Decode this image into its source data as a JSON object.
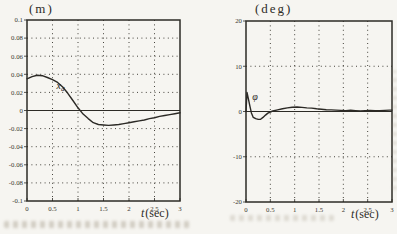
{
  "figure": {
    "paper_color": "#f6f5f1",
    "ink_color": "#2d2b26"
  },
  "chart_data": [
    {
      "type": "line",
      "title": "(m)",
      "xlabel": "t(sec)",
      "xlabel_parts": {
        "main": "t",
        "rest": "(sec)"
      },
      "xlim": [
        0,
        3
      ],
      "ylim": [
        -0.1,
        0.1
      ],
      "grid": "dotted",
      "legend": "none",
      "xticks": [
        {
          "v": 0,
          "label": "0"
        },
        {
          "v": 0.5,
          "label": "0.5"
        },
        {
          "v": 1,
          "label": "1"
        },
        {
          "v": 1.5,
          "label": "1.5"
        },
        {
          "v": 2,
          "label": "2"
        },
        {
          "v": 2.5,
          "label": "2.5"
        },
        {
          "v": 3,
          "label": "3"
        }
      ],
      "yticks": [
        {
          "v": 0.1,
          "label": "0.1"
        },
        {
          "v": 0.08,
          "label": "0.08"
        },
        {
          "v": 0.06,
          "label": "0.06"
        },
        {
          "v": 0.04,
          "label": "0.04"
        },
        {
          "v": 0.02,
          "label": "0.02"
        },
        {
          "v": 0,
          "label": "0"
        },
        {
          "v": -0.02,
          "label": "-0.02"
        },
        {
          "v": -0.04,
          "label": "-0.04"
        },
        {
          "v": -0.06,
          "label": "-0.06"
        },
        {
          "v": -0.08,
          "label": "-0.08"
        },
        {
          "v": -0.1,
          "label": "-0.1"
        }
      ],
      "series": [
        {
          "name": "x_d",
          "annotation": {
            "main": "x",
            "sub": "d",
            "at_t": 0.58,
            "at_y": 0.024
          },
          "points": [
            [
              0,
              0.035
            ],
            [
              0.1,
              0.0375
            ],
            [
              0.2,
              0.039
            ],
            [
              0.3,
              0.0385
            ],
            [
              0.4,
              0.0365
            ],
            [
              0.5,
              0.034
            ],
            [
              0.6,
              0.031
            ],
            [
              0.7,
              0.026
            ],
            [
              0.8,
              0.019
            ],
            [
              0.9,
              0.011
            ],
            [
              1.0,
              0.003
            ],
            [
              1.1,
              -0.004
            ],
            [
              1.2,
              -0.009
            ],
            [
              1.3,
              -0.0135
            ],
            [
              1.4,
              -0.0155
            ],
            [
              1.5,
              -0.016
            ],
            [
              1.6,
              -0.0165
            ],
            [
              1.7,
              -0.016
            ],
            [
              1.8,
              -0.0155
            ],
            [
              1.9,
              -0.0145
            ],
            [
              2.0,
              -0.0135
            ],
            [
              2.1,
              -0.0125
            ],
            [
              2.2,
              -0.0115
            ],
            [
              2.3,
              -0.0105
            ],
            [
              2.4,
              -0.009
            ],
            [
              2.5,
              -0.008
            ],
            [
              2.6,
              -0.0065
            ],
            [
              2.7,
              -0.0055
            ],
            [
              2.8,
              -0.0045
            ],
            [
              2.9,
              -0.0035
            ],
            [
              3.0,
              -0.0025
            ]
          ]
        }
      ]
    },
    {
      "type": "line",
      "title": "(deg)",
      "xlabel": "t(sec)",
      "xlabel_parts": {
        "main": "t",
        "rest": "(sec)"
      },
      "xlim": [
        0,
        3
      ],
      "ylim": [
        -20,
        20
      ],
      "grid": "dotted",
      "legend": "none",
      "xticks": [
        {
          "v": 0,
          "label": "0"
        },
        {
          "v": 0.5,
          "label": "0.5"
        },
        {
          "v": 1,
          "label": "1"
        },
        {
          "v": 1.5,
          "label": "1.5"
        },
        {
          "v": 2,
          "label": "2"
        },
        {
          "v": 2.5,
          "label": "2.5"
        },
        {
          "v": 3,
          "label": "3"
        }
      ],
      "yticks": [
        {
          "v": 20,
          "label": "20"
        },
        {
          "v": 10,
          "label": "10"
        },
        {
          "v": 0,
          "label": "0"
        },
        {
          "v": -10,
          "label": "-10"
        },
        {
          "v": -20,
          "label": "-20"
        }
      ],
      "series": [
        {
          "name": "phi",
          "annotation": {
            "main": "φ",
            "sub": "",
            "at_t": 0.13,
            "at_y": 2.6
          },
          "points": [
            [
              0,
              0.0
            ],
            [
              0.02,
              4.2
            ],
            [
              0.05,
              2.8
            ],
            [
              0.08,
              1.2
            ],
            [
              0.11,
              -0.3
            ],
            [
              0.15,
              -1.3
            ],
            [
              0.2,
              -1.6
            ],
            [
              0.25,
              -1.75
            ],
            [
              0.3,
              -1.7
            ],
            [
              0.35,
              -1.3
            ],
            [
              0.4,
              -0.8
            ],
            [
              0.45,
              -0.35
            ],
            [
              0.5,
              -0.1
            ],
            [
              0.55,
              0.1
            ],
            [
              0.65,
              0.35
            ],
            [
              0.75,
              0.6
            ],
            [
              0.85,
              0.8
            ],
            [
              0.95,
              0.95
            ],
            [
              1.05,
              1.0
            ],
            [
              1.15,
              0.9
            ],
            [
              1.25,
              0.8
            ],
            [
              1.35,
              0.75
            ],
            [
              1.45,
              0.6
            ],
            [
              1.55,
              0.5
            ],
            [
              1.65,
              0.4
            ],
            [
              1.75,
              0.35
            ],
            [
              1.85,
              0.3
            ],
            [
              1.95,
              0.25
            ],
            [
              2.05,
              0.2
            ],
            [
              2.15,
              0.3
            ],
            [
              2.25,
              0.2
            ],
            [
              2.35,
              0.1
            ],
            [
              2.45,
              0.2
            ],
            [
              2.55,
              0.25
            ],
            [
              2.65,
              0.15
            ],
            [
              2.75,
              0.2
            ],
            [
              2.85,
              0.25
            ],
            [
              2.95,
              0.3
            ],
            [
              3.0,
              0.3
            ]
          ]
        }
      ]
    }
  ]
}
